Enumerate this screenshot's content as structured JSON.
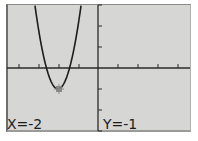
{
  "calculator": {
    "screen": "graph",
    "function": "y = 3(x+2)^2 - 1",
    "trace": {
      "x_label": "X=-2",
      "y_label": "Y=-1",
      "x": -2,
      "y": -1
    },
    "window": {
      "xmin": -4.6,
      "xmax": 4.6,
      "xscl": 1,
      "ymin": -3,
      "ymax": 3,
      "yscl": 1
    },
    "colors": {
      "screen_bg": "#d6d6d4",
      "curve": "#1c1c1c",
      "axes": "#2a2a2a",
      "cursor": "#6a6a6a"
    }
  }
}
